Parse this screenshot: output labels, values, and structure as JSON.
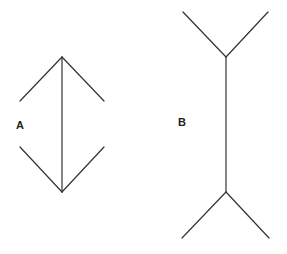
{
  "diagram": {
    "figures": [
      {
        "label": "A",
        "description": "vertical shaft with inward-pointing arrowheads (fins converge at ends)",
        "shaft": {
          "x": 62,
          "y1": 57,
          "y2": 192
        },
        "fins": [
          {
            "from": [
              62,
              57
            ],
            "to": [
              20,
              101
            ]
          },
          {
            "from": [
              62,
              57
            ],
            "to": [
              104,
              101
            ]
          },
          {
            "from": [
              62,
              192
            ],
            "to": [
              20,
              147
            ]
          },
          {
            "from": [
              62,
              192
            ],
            "to": [
              104,
              147
            ]
          }
        ]
      },
      {
        "label": "B",
        "description": "vertical shaft with outward-pointing fins (tails diverge at ends)",
        "shaft": {
          "x": 226,
          "y1": 57,
          "y2": 192
        },
        "fins": [
          {
            "from": [
              226,
              57
            ],
            "to": [
              183,
              12
            ]
          },
          {
            "from": [
              226,
              57
            ],
            "to": [
              268,
              12
            ]
          },
          {
            "from": [
              226,
              192
            ],
            "to": [
              182,
              238
            ]
          },
          {
            "from": [
              226,
              192
            ],
            "to": [
              269,
              238
            ]
          }
        ]
      }
    ],
    "colors": {
      "line": "#333333",
      "background": "#ffffff",
      "text": "#222222"
    }
  }
}
